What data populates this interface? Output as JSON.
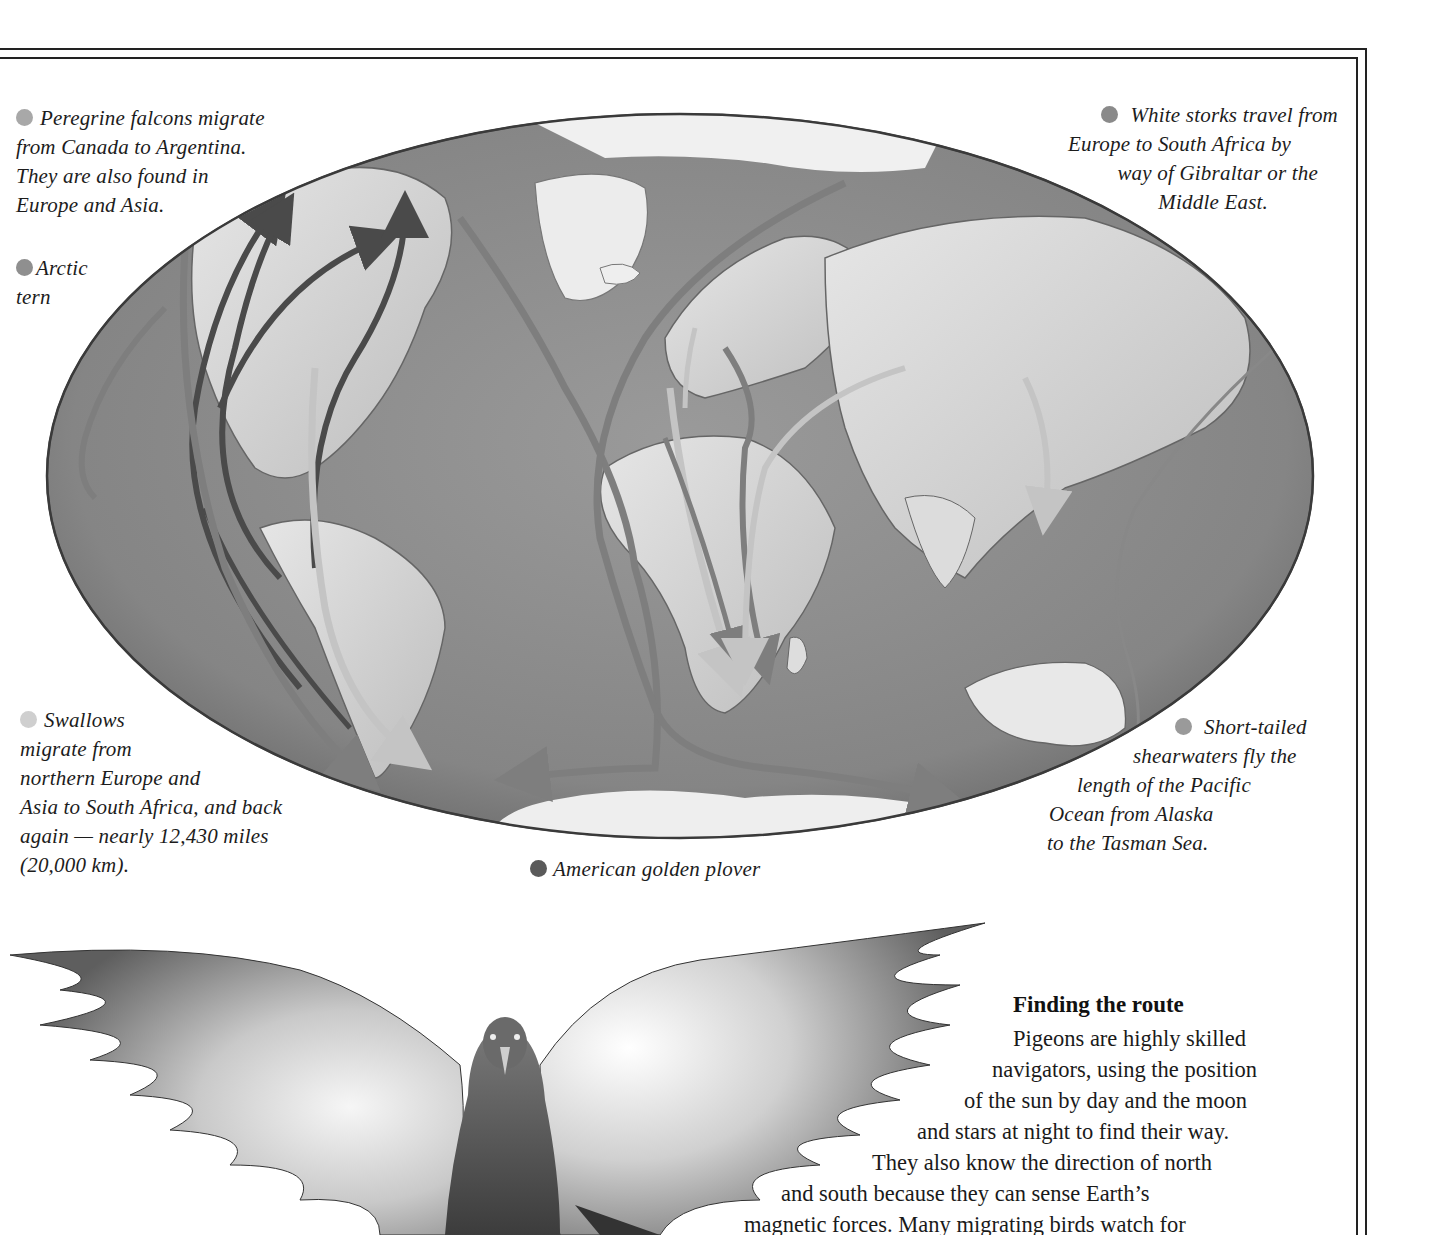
{
  "legend": {
    "peregrine": {
      "color": "#a8a8a8",
      "lines": [
        "Peregrine falcons migrate",
        "from Canada to Argentina.",
        "They are also found in",
        "Europe and Asia."
      ]
    },
    "arctic_tern": {
      "color": "#8f8f8f",
      "lines": [
        "Arctic",
        "tern"
      ]
    },
    "white_storks": {
      "color": "#8a8a8a",
      "lines": [
        "White storks travel from",
        "Europe to South Africa by",
        "way of Gibraltar or the",
        "Middle East."
      ]
    },
    "swallows": {
      "color": "#cfcfcf",
      "lines": [
        "Swallows",
        "migrate from",
        "northern Europe and",
        "Asia to South Africa, and back",
        "again — nearly 12,430 miles",
        "(20,000 km)."
      ]
    },
    "shearwaters": {
      "color": "#9a9a9a",
      "lines": [
        "Short-tailed",
        "shearwaters fly the",
        "length of the Pacific",
        "Ocean from Alaska",
        "to the Tasman Sea."
      ]
    },
    "golden_plover": {
      "color": "#5a5a5a",
      "label": "American golden plover"
    }
  },
  "section": {
    "title": "Finding the route",
    "lines": [
      "Pigeons are highly skilled",
      "navigators, using the position",
      "of the sun by day and the moon",
      "and stars at night to find their way.",
      "They also know the direction of north",
      "and south because they can sense Earth’s",
      "magnetic forces. Many migrating birds watch for"
    ]
  },
  "map": {
    "ocean_color": "#8c8c8c",
    "land_color": "#d8d8d8",
    "ice_color": "#f2f2f2",
    "route_dark": "#4a4a4a",
    "route_mid": "#7e7e7e",
    "route_light": "#bdbdbd"
  }
}
